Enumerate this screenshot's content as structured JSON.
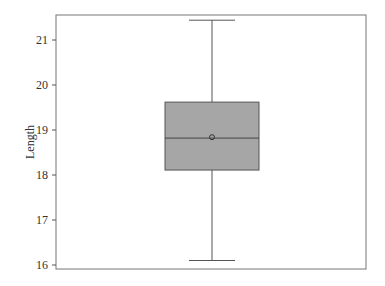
{
  "chart_data": {
    "type": "box",
    "title": "",
    "xlabel": "",
    "ylabel": "Length",
    "ylim": [
      15.9,
      21.55
    ],
    "yticks": [
      16,
      17,
      18,
      19,
      20,
      21
    ],
    "grid": false,
    "legend": null,
    "series": [
      {
        "name": "Length",
        "whisker_low": 16.1,
        "q1": 18.11,
        "median": 18.82,
        "mean": 18.84,
        "q3": 19.62,
        "whisker_high": 21.44
      }
    ],
    "colors": {
      "box_fill": "#a6a6a6",
      "box_stroke": "#555555",
      "frame": "#777777"
    }
  }
}
